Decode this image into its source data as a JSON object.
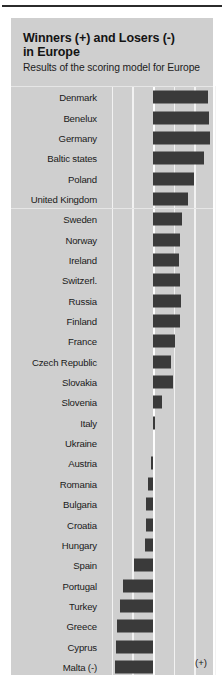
{
  "header": {
    "title_line1": "Winners (+) and Losers (-)",
    "title_line2": "in Europe",
    "subtitle": "Results of the scoring model for Europe"
  },
  "axis": {
    "positive_sign": "(+)",
    "negative_sign_note": "Malta (-)"
  },
  "chart_data": {
    "type": "bar",
    "orientation": "horizontal",
    "title": "Winners (+) and Losers (-) in Europe",
    "subtitle": "Results of the scoring model for Europe",
    "xlabel": "",
    "ylabel": "",
    "grid": true,
    "legend": "none",
    "bar_color": "#3a3a3a",
    "background": "#cfcfcf",
    "xlim": [
      -2.0,
      3.4
    ],
    "zero_line": 0,
    "gridline_values": [
      -2.0,
      -1.0,
      0,
      1.0,
      2.0,
      3.0
    ],
    "axis_annotations": [
      {
        "text": "(+)",
        "side": "right"
      },
      {
        "text": "(-)",
        "side": "left"
      }
    ],
    "categories": [
      "Denmark",
      "Benelux",
      "Germany",
      "Baltic states",
      "Poland",
      "United Kingdom",
      "Sweden",
      "Norway",
      "Ireland",
      "Switzerl.",
      "Russia",
      "Finland",
      "France",
      "Czech Republic",
      "Slovakia",
      "Slovenia",
      "Italy",
      "Ukraine",
      "Austria",
      "Romania",
      "Bulgaria",
      "Croatia",
      "Hungary",
      "Spain",
      "Portugal",
      "Turkey",
      "Greece",
      "Cyprus",
      "Malta (-)"
    ],
    "values": [
      2.67,
      2.72,
      2.77,
      2.48,
      2.0,
      1.7,
      1.38,
      1.3,
      1.28,
      1.29,
      1.33,
      1.32,
      1.06,
      0.85,
      0.95,
      0.42,
      0.1,
      0.0,
      -0.12,
      -0.25,
      -0.33,
      -0.35,
      -0.37,
      -0.93,
      -1.43,
      -1.6,
      -1.72,
      -1.78,
      -1.83
    ]
  },
  "rows": [
    {
      "label": "Denmark",
      "value": 2.67
    },
    {
      "label": "Benelux",
      "value": 2.72
    },
    {
      "label": "Germany",
      "value": 2.77
    },
    {
      "label": "Baltic states",
      "value": 2.48
    },
    {
      "label": "Poland",
      "value": 2.0
    },
    {
      "label": "United Kingdom",
      "value": 1.7
    },
    {
      "label": "Sweden",
      "value": 1.38
    },
    {
      "label": "Norway",
      "value": 1.3
    },
    {
      "label": "Ireland",
      "value": 1.28
    },
    {
      "label": "Switzerl.",
      "value": 1.29
    },
    {
      "label": "Russia",
      "value": 1.33
    },
    {
      "label": "Finland",
      "value": 1.32
    },
    {
      "label": "France",
      "value": 1.06
    },
    {
      "label": "Czech Republic",
      "value": 0.85
    },
    {
      "label": "Slovakia",
      "value": 0.95
    },
    {
      "label": "Slovenia",
      "value": 0.42
    },
    {
      "label": "Italy",
      "value": 0.1
    },
    {
      "label": "Ukraine",
      "value": 0.0
    },
    {
      "label": "Austria",
      "value": -0.12
    },
    {
      "label": "Romania",
      "value": -0.25
    },
    {
      "label": "Bulgaria",
      "value": -0.33
    },
    {
      "label": "Croatia",
      "value": -0.35
    },
    {
      "label": "Hungary",
      "value": -0.37
    },
    {
      "label": "Spain",
      "value": -0.93
    },
    {
      "label": "Portugal",
      "value": -1.43
    },
    {
      "label": "Turkey",
      "value": -1.6
    },
    {
      "label": "Greece",
      "value": -1.72
    },
    {
      "label": "Cyprus",
      "value": -1.78
    },
    {
      "label": "Malta (-)",
      "value": -1.83
    }
  ]
}
